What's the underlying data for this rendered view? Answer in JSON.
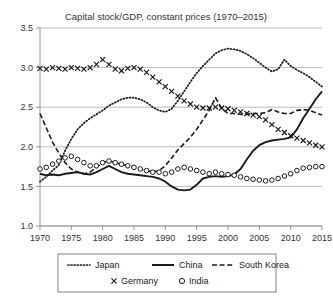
{
  "chart_data": {
    "type": "line",
    "title": "Capital stock/GDP, constant prices (1970–2015)",
    "xlabel": "",
    "ylabel": "",
    "xlim": [
      1970,
      2015
    ],
    "ylim": [
      1.0,
      3.5
    ],
    "grid": true,
    "legend_position": "bottom",
    "y_ticks": [
      "1.0",
      "1.5",
      "2.0",
      "2.5",
      "3.0",
      "3.5"
    ],
    "y_tick_values": [
      1.0,
      1.5,
      2.0,
      2.5,
      3.0,
      3.5
    ],
    "x_ticks": [
      "1970",
      "1975",
      "1980",
      "1985",
      "1990",
      "1995",
      "2000",
      "2005",
      "2010",
      "2015"
    ],
    "x_tick_values": [
      1970,
      1975,
      1980,
      1985,
      1990,
      1995,
      2000,
      2005,
      2010,
      2015
    ],
    "x": [
      1970,
      1971,
      1972,
      1973,
      1974,
      1975,
      1976,
      1977,
      1978,
      1979,
      1980,
      1981,
      1982,
      1983,
      1984,
      1985,
      1986,
      1987,
      1988,
      1989,
      1990,
      1991,
      1992,
      1993,
      1994,
      1995,
      1996,
      1997,
      1998,
      1999,
      2000,
      2001,
      2002,
      2003,
      2004,
      2005,
      2006,
      2007,
      2008,
      2009,
      2010,
      2011,
      2012,
      2013,
      2014,
      2015
    ],
    "series": [
      {
        "name": "Japan",
        "style": "dotted",
        "marker": "none",
        "color": "#1a1a1a",
        "values": [
          1.56,
          1.62,
          1.7,
          1.77,
          1.95,
          2.1,
          2.22,
          2.3,
          2.36,
          2.41,
          2.46,
          2.52,
          2.56,
          2.6,
          2.62,
          2.62,
          2.6,
          2.56,
          2.5,
          2.46,
          2.44,
          2.48,
          2.58,
          2.7,
          2.82,
          2.93,
          3.02,
          3.1,
          3.18,
          3.22,
          3.24,
          3.23,
          3.21,
          3.17,
          3.12,
          3.06,
          3.0,
          2.95,
          2.98,
          3.1,
          3.02,
          2.97,
          2.93,
          2.88,
          2.82,
          2.76
        ]
      },
      {
        "name": "China",
        "style": "solid",
        "marker": "none",
        "color": "#1a1a1a",
        "values": [
          1.66,
          1.64,
          1.65,
          1.64,
          1.66,
          1.67,
          1.68,
          1.66,
          1.65,
          1.68,
          1.72,
          1.76,
          1.72,
          1.68,
          1.66,
          1.65,
          1.64,
          1.63,
          1.62,
          1.6,
          1.56,
          1.5,
          1.46,
          1.45,
          1.46,
          1.52,
          1.6,
          1.62,
          1.63,
          1.62,
          1.63,
          1.65,
          1.72,
          1.84,
          1.95,
          2.02,
          2.06,
          2.08,
          2.09,
          2.1,
          2.12,
          2.22,
          2.36,
          2.48,
          2.6,
          2.7
        ]
      },
      {
        "name": "South Korea",
        "style": "dashed",
        "marker": "none",
        "color": "#1a1a1a",
        "values": [
          2.42,
          2.24,
          2.06,
          1.92,
          1.8,
          1.72,
          1.68,
          1.66,
          1.68,
          1.74,
          1.8,
          1.82,
          1.8,
          1.78,
          1.76,
          1.74,
          1.72,
          1.7,
          1.68,
          1.7,
          1.76,
          1.86,
          1.96,
          2.04,
          2.12,
          2.22,
          2.34,
          2.46,
          2.62,
          2.48,
          2.42,
          2.42,
          2.41,
          2.41,
          2.42,
          2.42,
          2.43,
          2.47,
          2.44,
          2.42,
          2.42,
          2.46,
          2.47,
          2.46,
          2.43,
          2.4
        ]
      },
      {
        "name": "Germany",
        "style": "none",
        "marker": "x",
        "color": "#1a1a1a",
        "values": [
          2.99,
          2.98,
          3.0,
          2.99,
          2.98,
          3.0,
          2.99,
          2.98,
          3.0,
          3.04,
          3.1,
          3.04,
          2.98,
          2.96,
          2.99,
          3.0,
          2.98,
          2.94,
          2.88,
          2.82,
          2.76,
          2.7,
          2.64,
          2.58,
          2.54,
          2.5,
          2.49,
          2.49,
          2.5,
          2.49,
          2.48,
          2.46,
          2.44,
          2.42,
          2.4,
          2.38,
          2.34,
          2.28,
          2.22,
          2.18,
          2.14,
          2.11,
          2.08,
          2.05,
          2.02,
          2.0
        ]
      },
      {
        "name": "India",
        "style": "none",
        "marker": "o",
        "color": "#1a1a1a",
        "values": [
          1.72,
          1.74,
          1.78,
          1.82,
          1.86,
          1.88,
          1.84,
          1.8,
          1.76,
          1.76,
          1.8,
          1.82,
          1.8,
          1.78,
          1.76,
          1.74,
          1.72,
          1.7,
          1.68,
          1.68,
          1.66,
          1.68,
          1.72,
          1.74,
          1.72,
          1.7,
          1.68,
          1.66,
          1.68,
          1.66,
          1.65,
          1.64,
          1.62,
          1.6,
          1.59,
          1.58,
          1.57,
          1.58,
          1.6,
          1.63,
          1.66,
          1.7,
          1.73,
          1.74,
          1.75,
          1.75
        ]
      }
    ]
  },
  "legend": {
    "rows": [
      [
        {
          "label": "Japan",
          "swatch": "dotted-line-swatch"
        },
        {
          "label": "China",
          "swatch": "solid-line-swatch"
        },
        {
          "label": "South Korea",
          "swatch": "dashed-line-swatch"
        }
      ],
      [
        {
          "label": "Germany",
          "swatch": "x-marker-swatch"
        },
        {
          "label": "India",
          "swatch": "circle-marker-swatch"
        }
      ]
    ]
  }
}
